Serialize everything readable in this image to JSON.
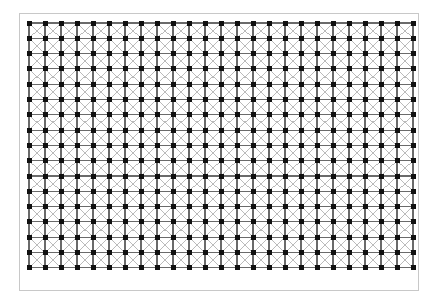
{
  "figure": {
    "title": "Structured quadrilateral lattice mesh with diagonal bracing",
    "background_color": "#ffffff",
    "frame": {
      "border_color": "#c8c8c8",
      "border_width": 1,
      "x": 19,
      "y": 13,
      "width": 400,
      "height": 278
    }
  },
  "chart_data": {
    "type": "diagram",
    "subtype": "lattice-grid",
    "title": "",
    "xlabel": "",
    "ylabel": "",
    "grid": {
      "columns": 25,
      "rows": 17,
      "node_count": 425,
      "spacing_x": 16.0,
      "spacing_y": 15.3,
      "origin_x": 9,
      "origin_y": 9,
      "node_shape": "square",
      "node_size": 5,
      "node_color": "#101010"
    },
    "edges": {
      "horizontal": {
        "color": "#6a6a6a",
        "width": 1.1,
        "count": 408
      },
      "vertical": {
        "color": "#6a6a6a",
        "width": 1.1,
        "count": 400
      },
      "diagonal_down": {
        "color": "#b4b4b4",
        "width": 0.9,
        "count": 384
      },
      "diagonal_up": {
        "color": "#b4b4b4",
        "width": 0.9,
        "count": 384
      }
    },
    "legend": [],
    "annotations": []
  }
}
